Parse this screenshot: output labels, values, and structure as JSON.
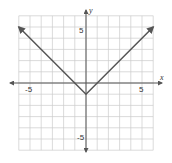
{
  "chart_data": {
    "type": "line",
    "title": "",
    "function": "y = |x| - 1",
    "xlabel": "x",
    "ylabel": "y",
    "xlim": [
      -6,
      6
    ],
    "ylim": [
      -6,
      6
    ],
    "grid": true,
    "x_ticks_labeled": [
      -5,
      5
    ],
    "y_ticks_labeled": [
      5,
      -5
    ],
    "tick_labels": {
      "x_neg": "-5",
      "x_pos": "5",
      "y_pos": "5",
      "y_neg": "-5"
    },
    "series": [
      {
        "name": "y = |x| - 1",
        "points": [
          [
            -6,
            5
          ],
          [
            0,
            -1
          ],
          [
            6,
            5
          ]
        ],
        "arrows": "both-ends"
      }
    ],
    "colors": {
      "line": "#555555",
      "grid": "#cccccc",
      "axis": "#555555"
    }
  }
}
